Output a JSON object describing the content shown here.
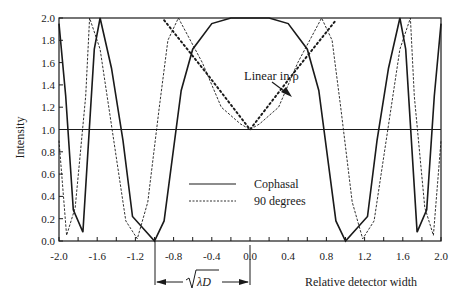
{
  "chart_data": {
    "type": "line",
    "title": "",
    "xlabel": "Relative detector width",
    "ylabel": "Intensity",
    "xlim": [
      -2.0,
      2.0
    ],
    "ylim": [
      0.0,
      2.0
    ],
    "x_ticks": [
      "-2.0",
      "-1.6",
      "-1.2",
      "-0.8",
      "-0.4",
      "0.0",
      "0.4",
      "0.8",
      "1.2",
      "1.6",
      "2.0"
    ],
    "y_ticks": [
      "0.0",
      "0.2",
      "0.4",
      "0.6",
      "0.8",
      "1.0",
      "1.2",
      "1.4",
      "1.6",
      "1.8",
      "2.0"
    ],
    "grid": false,
    "reference_line": {
      "y": 1.0,
      "style": "solid"
    },
    "legend": {
      "position": "center-lower",
      "entries": [
        {
          "label": "Cophasal",
          "style": "solid"
        },
        {
          "label": "90 degrees",
          "style": "dashed"
        }
      ]
    },
    "series": [
      {
        "name": "Cophasal",
        "style": "solid",
        "x": [
          -2.0,
          -1.93,
          -1.85,
          -1.75,
          -1.63,
          -1.57,
          -1.45,
          -1.33,
          -1.23,
          -1.0,
          -0.9,
          -0.72,
          -0.6,
          -0.4,
          -0.2,
          0.0,
          0.2,
          0.4,
          0.6,
          0.72,
          0.9,
          1.0,
          1.23,
          1.33,
          1.45,
          1.57,
          1.63,
          1.75,
          1.85,
          1.93,
          2.0
        ],
        "values": [
          1.95,
          1.3,
          0.28,
          0.08,
          1.72,
          2.0,
          1.55,
          0.9,
          0.22,
          0.0,
          0.18,
          1.35,
          1.72,
          1.95,
          2.0,
          2.0,
          2.0,
          1.95,
          1.72,
          1.35,
          0.18,
          0.0,
          0.22,
          0.9,
          1.55,
          2.0,
          1.72,
          0.08,
          0.28,
          1.3,
          1.95
        ]
      },
      {
        "name": "90 degrees",
        "style": "dashed",
        "x": [
          -2.0,
          -1.92,
          -1.83,
          -1.72,
          -1.68,
          -1.57,
          -1.3,
          -1.18,
          -1.07,
          -0.95,
          -0.86,
          -0.75,
          -0.5,
          -0.3,
          -0.1,
          0.0,
          0.1,
          0.3,
          0.5,
          0.75,
          0.86,
          0.95,
          1.07,
          1.18,
          1.3,
          1.57,
          1.68,
          1.72,
          1.83,
          1.92,
          2.0
        ],
        "values": [
          0.9,
          0.05,
          0.3,
          1.3,
          2.0,
          1.72,
          0.18,
          0.02,
          0.35,
          1.2,
          1.8,
          2.0,
          1.6,
          1.2,
          1.05,
          1.0,
          1.05,
          1.2,
          1.6,
          2.0,
          1.8,
          1.2,
          0.35,
          0.02,
          0.18,
          1.72,
          2.0,
          1.3,
          0.3,
          0.05,
          0.9
        ]
      },
      {
        "name": "Linear in rho",
        "style": "dotted",
        "x": [
          -0.9,
          -0.45,
          0.0,
          0.45,
          0.9
        ],
        "values": [
          1.98,
          1.5,
          1.0,
          1.5,
          1.98
        ]
      }
    ],
    "annotations": [
      {
        "text": "Linear in ρ",
        "arrow_to": [
          0.58,
          1.55
        ]
      },
      {
        "text": "√λD",
        "type": "dimension",
        "from_x": -1.0,
        "to_x": 0.0
      }
    ]
  },
  "labels": {
    "ylabel": "Intensity",
    "xlabel": "Relative detector width",
    "legend_solid": "Cophasal",
    "legend_dashed": "90 degrees",
    "annotation": "Linear in ρ",
    "dimension": "√λD"
  }
}
